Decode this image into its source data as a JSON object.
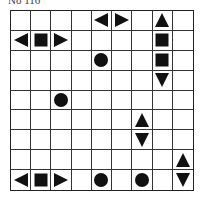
{
  "puzzle": {
    "title": "No 116",
    "rows": 9,
    "cols": 9,
    "colors": {
      "grid": "#222222",
      "piece": "#111111",
      "background": "#ffffff"
    },
    "pieces": [
      {
        "row": 0,
        "col": 4,
        "type": "left-end"
      },
      {
        "row": 0,
        "col": 5,
        "type": "right-end"
      },
      {
        "row": 0,
        "col": 7,
        "type": "top-end"
      },
      {
        "row": 1,
        "col": 0,
        "type": "left-end"
      },
      {
        "row": 1,
        "col": 1,
        "type": "middle"
      },
      {
        "row": 1,
        "col": 2,
        "type": "right-end"
      },
      {
        "row": 1,
        "col": 7,
        "type": "middle"
      },
      {
        "row": 2,
        "col": 4,
        "type": "submarine"
      },
      {
        "row": 2,
        "col": 7,
        "type": "middle"
      },
      {
        "row": 3,
        "col": 7,
        "type": "bottom-end"
      },
      {
        "row": 4,
        "col": 2,
        "type": "submarine"
      },
      {
        "row": 5,
        "col": 6,
        "type": "top-end"
      },
      {
        "row": 6,
        "col": 6,
        "type": "bottom-end"
      },
      {
        "row": 7,
        "col": 8,
        "type": "top-end"
      },
      {
        "row": 8,
        "col": 0,
        "type": "left-end"
      },
      {
        "row": 8,
        "col": 1,
        "type": "middle"
      },
      {
        "row": 8,
        "col": 2,
        "type": "right-end"
      },
      {
        "row": 8,
        "col": 4,
        "type": "submarine"
      },
      {
        "row": 8,
        "col": 6,
        "type": "submarine"
      },
      {
        "row": 8,
        "col": 8,
        "type": "bottom-end"
      }
    ]
  }
}
